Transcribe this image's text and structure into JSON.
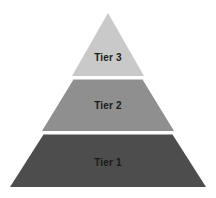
{
  "diagram": {
    "type": "pyramid",
    "background_color": "#ffffff",
    "divider_color": "#ffffff",
    "label_color": "#1a1a1a",
    "tiers": [
      {
        "id": "tier-3",
        "label": "Tier 3",
        "level": 3,
        "position": "top",
        "color": "#c9c9c9"
      },
      {
        "id": "tier-2",
        "label": "Tier 2",
        "level": 2,
        "position": "middle",
        "color": "#8f8f8f"
      },
      {
        "id": "tier-1",
        "label": "Tier 1",
        "level": 1,
        "position": "bottom",
        "color": "#4d4d4d"
      }
    ]
  }
}
